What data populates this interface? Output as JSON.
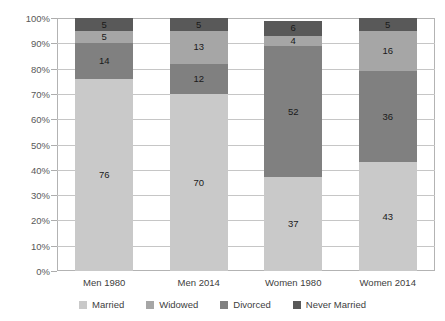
{
  "chart_data": {
    "type": "bar",
    "subtype": "100% stacked bar",
    "title": "",
    "xlabel": "",
    "ylabel": "",
    "ylim": [
      0,
      100
    ],
    "ytick_labels": [
      "0%",
      "10%",
      "20%",
      "30%",
      "40%",
      "50%",
      "60%",
      "70%",
      "80%",
      "90%",
      "100%"
    ],
    "ytick_values": [
      0,
      10,
      20,
      30,
      40,
      50,
      60,
      70,
      80,
      90,
      100
    ],
    "grid": true,
    "legend_position": "bottom",
    "categories": [
      "Men 1980",
      "Men 2014",
      "Women 1980",
      "Women 2014"
    ],
    "stack_order_bottom_to_top": [
      "Married",
      "Divorced",
      "Widowed",
      "Never Married"
    ],
    "series": [
      {
        "name": "Married",
        "color": "#c9c9c9",
        "values": [
          76,
          70,
          37,
          43
        ]
      },
      {
        "name": "Widowed",
        "color": "#a6a6a6",
        "values": [
          5,
          13,
          4,
          16
        ]
      },
      {
        "name": "Divorced",
        "color": "#808080",
        "values": [
          14,
          12,
          52,
          36
        ]
      },
      {
        "name": "Never Married",
        "color": "#595959",
        "values": [
          5,
          5,
          6,
          5
        ]
      }
    ]
  },
  "legend": {
    "items": [
      {
        "label": "Married",
        "color": "#c9c9c9"
      },
      {
        "label": "Widowed",
        "color": "#a6a6a6"
      },
      {
        "label": "Divorced",
        "color": "#808080"
      },
      {
        "label": "Never Married",
        "color": "#595959"
      }
    ]
  },
  "axis": {
    "y_ticks": [
      "0%",
      "10%",
      "20%",
      "30%",
      "40%",
      "50%",
      "60%",
      "70%",
      "80%",
      "90%",
      "100%"
    ],
    "x_labels": [
      "Men 1980",
      "Men 2014",
      "Women 1980",
      "Women 2014"
    ]
  }
}
